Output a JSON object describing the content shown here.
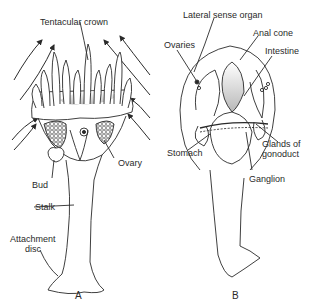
{
  "figure_a": {
    "letter": "A",
    "labels": {
      "tentacular_crown": "Tentacular crown",
      "ovary": "Ovary",
      "bud": "Bud",
      "stalk": "Stalk",
      "attachment_disc_line1": "Attachment",
      "attachment_disc_line2": "disc"
    }
  },
  "figure_b": {
    "letter": "B",
    "labels": {
      "lateral_sense_organ": "Lateral sense organ",
      "anal_cone": "Anal cone",
      "ovaries": "Ovaries",
      "intestine": "Intestine",
      "stomach": "Stomach",
      "glands_line1": "Glands of",
      "glands_line2": "gonoduct",
      "ganglion": "Ganglion"
    }
  },
  "colors": {
    "ink": "#2a2a2a",
    "stipple": "#bdbdbd",
    "background": "#ffffff"
  }
}
